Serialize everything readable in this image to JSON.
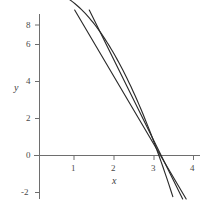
{
  "chart_data": {
    "type": "line",
    "title": "",
    "xlabel": "x",
    "ylabel": "y",
    "xlim": [
      -0.15,
      4.25
    ],
    "ylim": [
      -2.35,
      9.6
    ],
    "grid": false,
    "legend": "none",
    "background_color": "#ffffff",
    "line_color": "#2b2b2b",
    "axis_color": "#6e6e6e",
    "xticks": [
      1,
      2,
      3,
      4
    ],
    "xtick_labels": [
      "1",
      "2",
      "3",
      "4"
    ],
    "yticks": [
      -2,
      0,
      2,
      4,
      6,
      8
    ],
    "ytick_labels": [
      "-2",
      "0",
      "2",
      "4",
      "6",
      "8"
    ],
    "series": [
      {
        "name": "curve",
        "kind": "parabola",
        "equation": "y = 9 - x^2",
        "x": [
          0,
          0.25,
          0.5,
          0.75,
          1,
          1.25,
          1.5,
          1.75,
          2,
          2.25,
          2.5,
          2.75,
          3,
          3.25,
          3.4
        ],
        "values": [
          9,
          8.94,
          8.75,
          8.44,
          8,
          7.44,
          6.75,
          5.94,
          5,
          3.94,
          2.75,
          1.44,
          0,
          -1.56,
          -2.56
        ]
      },
      {
        "name": "tangent-line-left",
        "kind": "line",
        "equation": "y = -4.35x + 13.3",
        "x": [
          1.15,
          3.48
        ],
        "values": [
          8.3,
          -1.84
        ]
      },
      {
        "name": "tangent-line-right",
        "kind": "line",
        "equation": "y = -3.65x + 11.1",
        "x": [
          1.45,
          3.63
        ],
        "values": [
          5.8,
          -2.15
        ]
      }
    ]
  },
  "axes": {
    "x_label": "x",
    "y_label": "y"
  }
}
